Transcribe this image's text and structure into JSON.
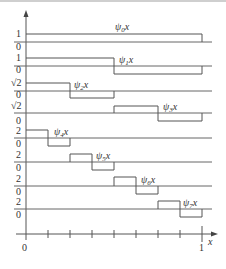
{
  "figure": {
    "colors": {
      "line": "#555555",
      "baseline": "#666666",
      "text": "#333333",
      "background": "#ffffff"
    },
    "axes": {
      "x_label": "x",
      "origin_label": "0",
      "x_end_label": "1",
      "x_ticks": [
        "0",
        "1/8",
        "2/8",
        "3/8",
        "4/8",
        "5/8",
        "6/8",
        "7/8",
        "1"
      ]
    },
    "rows": [
      {
        "name": "psi0",
        "label_main": "ψ",
        "label_sub": "0",
        "label_tail": "x",
        "top_label": "1",
        "zero_label": "0",
        "amplitude": "1",
        "steps": [
          [
            0,
            1,
            1
          ]
        ]
      },
      {
        "name": "psi1",
        "label_main": "ψ",
        "label_sub": "1",
        "label_tail": "x",
        "top_label": "1",
        "zero_label": "0",
        "amplitude": "1",
        "steps": [
          [
            0,
            0.5,
            1
          ],
          [
            0.5,
            1,
            -1
          ]
        ]
      },
      {
        "name": "psi2",
        "label_main": "ψ",
        "label_sub": "2",
        "label_tail": "x",
        "top_label": "√2",
        "zero_label": "0",
        "amplitude": "√2",
        "steps": [
          [
            0,
            0.25,
            1
          ],
          [
            0.25,
            0.5,
            -1
          ]
        ]
      },
      {
        "name": "psi3",
        "label_main": "ψ",
        "label_sub": "3",
        "label_tail": "x",
        "top_label": "√2",
        "zero_label": "0",
        "amplitude": "√2",
        "steps": [
          [
            0.5,
            0.75,
            1
          ],
          [
            0.75,
            1,
            -1
          ]
        ]
      },
      {
        "name": "psi4",
        "label_main": "ψ",
        "label_sub": "4",
        "label_tail": "x",
        "top_label": "2",
        "zero_label": "0",
        "amplitude": "2",
        "steps": [
          [
            0,
            0.125,
            1
          ],
          [
            0.125,
            0.25,
            -1
          ]
        ]
      },
      {
        "name": "psi5",
        "label_main": "ψ",
        "label_sub": "5",
        "label_tail": "x",
        "top_label": "2",
        "zero_label": "0",
        "amplitude": "2",
        "steps": [
          [
            0.25,
            0.375,
            1
          ],
          [
            0.375,
            0.5,
            -1
          ]
        ]
      },
      {
        "name": "psi6",
        "label_main": "ψ",
        "label_sub": "6",
        "label_tail": "x",
        "top_label": "2",
        "zero_label": "0",
        "amplitude": "2",
        "steps": [
          [
            0.5,
            0.625,
            1
          ],
          [
            0.625,
            0.75,
            -1
          ]
        ]
      },
      {
        "name": "psi7",
        "label_main": "ψ",
        "label_sub": "7",
        "label_tail": "x",
        "top_label": "2",
        "zero_label": "0",
        "amplitude": "2",
        "steps": [
          [
            0.75,
            0.875,
            1
          ],
          [
            0.875,
            1,
            -1
          ]
        ]
      }
    ]
  }
}
